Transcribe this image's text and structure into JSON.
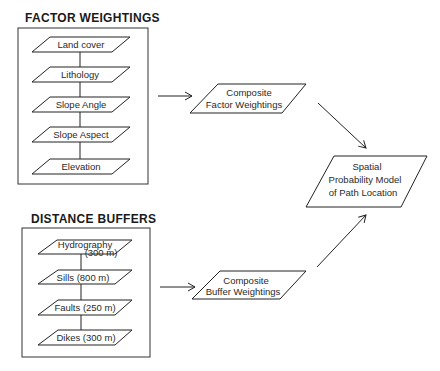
{
  "groups": [
    {
      "title": "FACTOR WEIGHTINGS",
      "layers": [
        "Land cover",
        "Lithology",
        "Slope Angle",
        "Slope Aspect",
        "Elevation"
      ]
    },
    {
      "title": "DISTANCE BUFFERS",
      "layers": [
        {
          "line1": "Hydrography",
          "line2": "(300  m)"
        },
        "Sills  (800  m)",
        "Faults  (250  m)",
        "Dikes  (300  m)"
      ]
    }
  ],
  "composites": {
    "factor": {
      "line1": "Composite",
      "line2": "Factor  Weightings"
    },
    "buffer": {
      "line1": "Composite",
      "line2": "Buffer  Weightings"
    }
  },
  "output": {
    "line1": "Spatial",
    "line2": "Probability  Model",
    "line3": "of Path Location"
  },
  "colors": {
    "stroke": "#222222",
    "background": "#ffffff"
  }
}
